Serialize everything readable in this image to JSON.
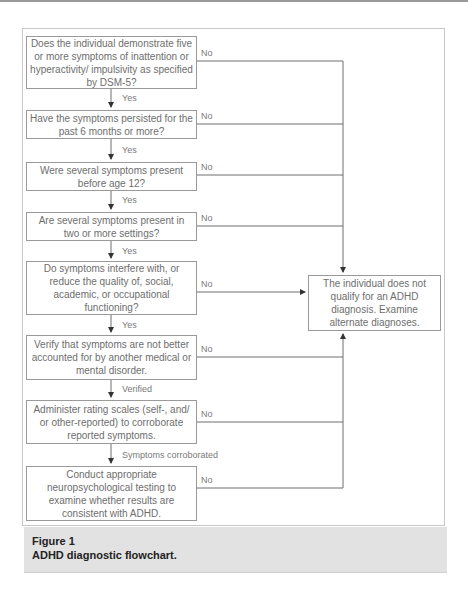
{
  "flowchart": {
    "steps": [
      {
        "text": "Does the individual demonstrate five or more symptoms of inattention or hyperactivity/ impulsivity as specified by DSM-5?",
        "yes_label": "Yes",
        "no_label": "No"
      },
      {
        "text": "Have the symptoms persisted for the past 6 months or more?",
        "yes_label": "Yes",
        "no_label": "No"
      },
      {
        "text": "Were several symptoms present before age 12?",
        "yes_label": "Yes",
        "no_label": "No"
      },
      {
        "text": "Are several symptoms present in two or more settings?",
        "yes_label": "Yes",
        "no_label": "No"
      },
      {
        "text": "Do symptoms interfere with, or reduce the quality of, social, academic, or occupational functioning?",
        "yes_label": "Yes",
        "no_label": "No"
      },
      {
        "text": "Verify that symptoms are not better accounted for by another medical or mental disorder.",
        "yes_label": "Verified",
        "no_label": "No"
      },
      {
        "text": "Administer rating scales (self-, and/ or other-reported) to corroborate reported symptoms.",
        "yes_label": "Symptoms corroborated",
        "no_label": "No"
      },
      {
        "text": "Conduct appropriate neuropsychological testing to examine whether results are consistent with ADHD.",
        "no_label": "No"
      }
    ],
    "outcome": "The individual does not qualify for an ADHD diagnosis. Examine alternate diagnoses."
  },
  "caption": {
    "title": "Figure 1",
    "text": "ADHD diagnostic flowchart."
  },
  "colors": {
    "line": "#6e6e6e",
    "box_border": "#9a9a9a",
    "caption_bg": "#e2e2e2"
  }
}
